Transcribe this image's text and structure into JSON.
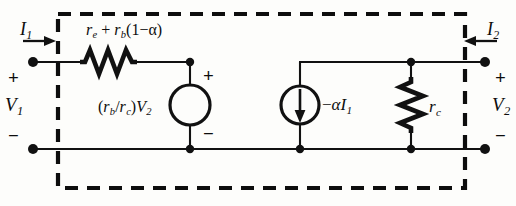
{
  "figure": {
    "kind": "two-port-equivalent-circuit",
    "box_label": "dashed-enclosure"
  },
  "colors": {
    "background": "#fdfdfb",
    "ink": "#0d0d0d",
    "wire": "#111111"
  },
  "ports": {
    "left": {
      "current_label": "I",
      "current_sub": "1",
      "current_direction": "into-network-rightward",
      "voltage_label": "V",
      "voltage_sub": "1",
      "polarity_top": "+",
      "polarity_bottom": "−"
    },
    "right": {
      "current_label": "I",
      "current_sub": "2",
      "current_direction": "into-network-leftward",
      "voltage_label": "V",
      "voltage_sub": "2",
      "polarity_top": "+",
      "polarity_bottom": "−"
    }
  },
  "components": {
    "series_resistor": {
      "type": "resistor",
      "orientation": "horizontal",
      "label_prefix": "r",
      "label_sub1": "e",
      "label_op": " + ",
      "label_r2": "r",
      "label_sub2": "b",
      "label_factor": "(1−α)",
      "full_label": "r_e + r_b(1−α)"
    },
    "voltage_source": {
      "type": "dependent-voltage-source",
      "shape": "circle",
      "label_open": "(",
      "label_rb": "r",
      "label_rb_sub": "b",
      "label_slash": "/",
      "label_rc": "r",
      "label_rc_sub": "c",
      "label_close": ")",
      "label_v": "V",
      "label_v_sub": "2",
      "full_label": "(r_b/r_c)V_2",
      "polarity_top": "+",
      "polarity_bottom": "−"
    },
    "current_source": {
      "type": "dependent-current-source",
      "shape": "circle-with-arrow",
      "arrow_direction": "down",
      "label_sign": "−",
      "label_alpha": "α",
      "label_i": "I",
      "label_i_sub": "1",
      "full_label": "−αI_1"
    },
    "shunt_resistor": {
      "type": "resistor",
      "orientation": "vertical",
      "label": "r",
      "label_sub": "c",
      "full_label": "r_c"
    }
  }
}
